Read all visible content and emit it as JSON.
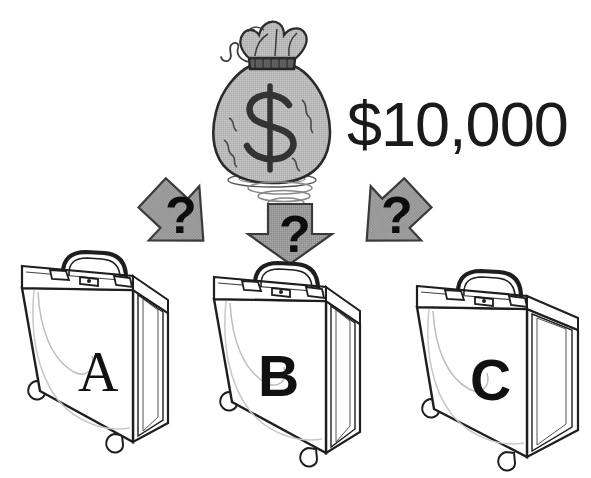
{
  "illustration": {
    "title": "Three briefcases with hidden prize money",
    "background_color": "#ffffff",
    "prize": {
      "amount_label": "$10,000",
      "bag_icon": "money-bag-icon",
      "bag_symbol": "$",
      "bag_fill": "#b9b9b9",
      "bag_outline": "#2b2b2b",
      "shadow_icon": "bag-shadow-ellipse",
      "coil_icon": "falling-coil-icon"
    },
    "arrows": [
      {
        "name": "arrow-left",
        "direction": "down-left",
        "label": "?",
        "fill": "#9a9a9a",
        "outline": "#3a3a3a"
      },
      {
        "name": "arrow-center",
        "direction": "down",
        "label": "?",
        "fill": "#9a9a9a",
        "outline": "#3a3a3a"
      },
      {
        "name": "arrow-right",
        "direction": "down-right",
        "label": "?",
        "fill": "#9a9a9a",
        "outline": "#3a3a3a"
      }
    ],
    "briefcases": [
      {
        "name": "briefcase-a",
        "label": "A",
        "label_style": "serif",
        "outline": "#1e1e1e",
        "body_fill": "#ffffff"
      },
      {
        "name": "briefcase-b",
        "label": "B",
        "label_style": "sans",
        "outline": "#1e1e1e",
        "body_fill": "#ffffff"
      },
      {
        "name": "briefcase-c",
        "label": "C",
        "label_style": "sans",
        "outline": "#1e1e1e",
        "body_fill": "#ffffff"
      }
    ]
  }
}
